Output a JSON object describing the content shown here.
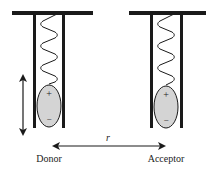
{
  "diagram": {
    "donor": {
      "label": "Donor",
      "plus_sign": "+",
      "minus_sign": "−",
      "fill_color": "#d4d4d4"
    },
    "acceptor": {
      "label": "Acceptor",
      "plus_sign": "+",
      "minus_sign": "−",
      "fill_color": "#d4d4d4"
    },
    "distance_label": "r",
    "colors": {
      "stroke": "#1a1a1a",
      "background": "#ffffff"
    }
  }
}
